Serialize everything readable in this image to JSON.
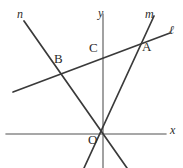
{
  "figure": {
    "width": 183,
    "height": 168,
    "background_color": "#ffffff",
    "line_color": "#3a3a3a",
    "axis_color": "#8a8a8a",
    "label_color": "#2b2b2b"
  },
  "axes": {
    "x_label": "x",
    "y_label": "y",
    "origin_label": "O",
    "x_axis": {
      "x1": 6,
      "y1": 134,
      "x2": 166,
      "y2": 134
    },
    "y_axis": {
      "x1": 103,
      "y1": 14,
      "x2": 103,
      "y2": 168
    },
    "origin": {
      "x": 103,
      "y": 134
    }
  },
  "lines": [
    {
      "name": "line-l",
      "label": "ℓ",
      "label_pos": {
        "x": 171,
        "y": 28
      },
      "x1": 13,
      "y1": 92,
      "x2": 170,
      "y2": 33
    },
    {
      "name": "line-m",
      "label": "m",
      "label_pos": {
        "x": 147,
        "y": 10
      },
      "x1": 154,
      "y1": 16,
      "x2": 84,
      "y2": 168
    },
    {
      "name": "line-n",
      "label": "n",
      "label_pos": {
        "x": 19,
        "y": 10
      },
      "x1": 24,
      "y1": 21,
      "x2": 127,
      "y2": 168
    }
  ],
  "points": [
    {
      "name": "point-a",
      "label": "A",
      "x": 141,
      "y": 42,
      "label_pos": {
        "x": 140,
        "y": 46
      }
    },
    {
      "name": "point-b",
      "label": "B",
      "x": 60,
      "y": 70,
      "label_pos": {
        "x": 55,
        "y": 55
      }
    },
    {
      "name": "point-c",
      "label": "C",
      "x": 103,
      "y": 60,
      "label_pos": {
        "x": 90,
        "y": 44
      }
    },
    {
      "name": "point-o",
      "label": "O",
      "x": 103,
      "y": 134,
      "label_pos": {
        "x": 88,
        "y": 136
      }
    }
  ]
}
